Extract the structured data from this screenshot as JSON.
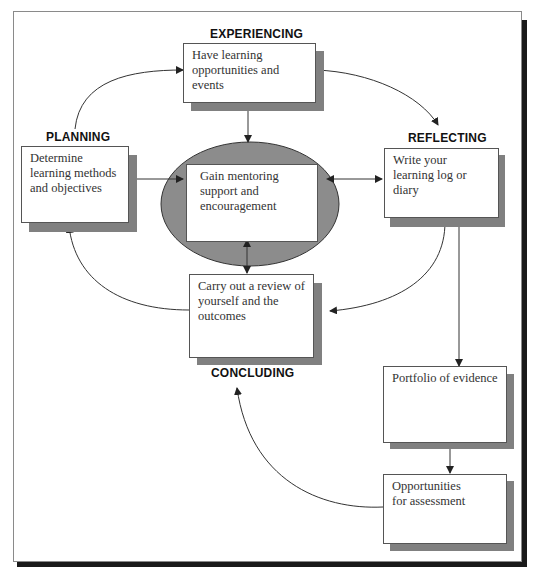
{
  "diagram": {
    "type": "learning cycle",
    "stages": {
      "experiencing": "EXPERIENCING",
      "planning": "PLANNING",
      "reflecting": "REFLECTING",
      "concluding": "CONCLUDING"
    },
    "boxes": {
      "experiencing": "Have learning opportunities and events",
      "planning": "Determine learning methods and objectives",
      "center": "Gain mentoring support and encouragement",
      "reflecting": "Write your learning log or diary",
      "concluding": "Carry out a review of yourself and the outcomes",
      "portfolio": "Portfolio of evidence",
      "assessment": "Opportunities for assessment"
    },
    "colors": {
      "ellipse_fill": "#8c8c8c",
      "box_shadow": "#808080",
      "frame_shadow": "#1a1a1a",
      "line": "#333333"
    }
  }
}
